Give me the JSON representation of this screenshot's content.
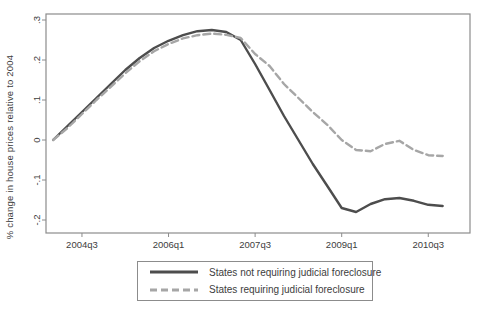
{
  "chart_data": {
    "type": "line",
    "title": "",
    "xlabel": "",
    "ylabel": "% change in house prices relative to 2004",
    "grid": false,
    "legend_position": "bottom-center-boxed",
    "ylim": [
      -0.2,
      0.3
    ],
    "colors": {
      "frame": "#8c8c8c",
      "text": "#3d3d3d",
      "background": "#ffffff"
    },
    "x": [
      "2004q1",
      "2004q2",
      "2004q3",
      "2004q4",
      "2005q1",
      "2005q2",
      "2005q3",
      "2005q4",
      "2006q1",
      "2006q2",
      "2006q3",
      "2006q4",
      "2007q1",
      "2007q2",
      "2007q3",
      "2007q4",
      "2008q1",
      "2008q2",
      "2008q3",
      "2008q4",
      "2009q1",
      "2009q2",
      "2009q3",
      "2009q4",
      "2010q1",
      "2010q2",
      "2010q3",
      "2010q4"
    ],
    "xticks": [
      {
        "label": "2004q3",
        "index": 2
      },
      {
        "label": "2006q1",
        "index": 8
      },
      {
        "label": "2007q3",
        "index": 14
      },
      {
        "label": "2009q1",
        "index": 20
      },
      {
        "label": "2010q3",
        "index": 26
      }
    ],
    "yticks": {
      "values": [
        0.3,
        0.2,
        0.1,
        0,
        -0.1,
        -0.2
      ],
      "labels": [
        ".3",
        ".2",
        ".1",
        "0",
        "-.1",
        "-.2"
      ]
    },
    "series": [
      {
        "name": "States not requiring judicial foreclosure",
        "style": "solid",
        "color": "#4d4d4d",
        "dash": "",
        "values": [
          0.0,
          0.035,
          0.07,
          0.105,
          0.14,
          0.175,
          0.205,
          0.23,
          0.248,
          0.262,
          0.272,
          0.275,
          0.27,
          0.25,
          0.19,
          0.125,
          0.06,
          0.0,
          -0.06,
          -0.115,
          -0.17,
          -0.18,
          -0.16,
          -0.148,
          -0.145,
          -0.152,
          -0.162,
          -0.165
        ]
      },
      {
        "name": "States requiring judicial foreclosure",
        "style": "dashed",
        "color": "#a6a6a6",
        "dash": "7 4",
        "values": [
          0.0,
          0.03,
          0.065,
          0.1,
          0.133,
          0.167,
          0.197,
          0.222,
          0.24,
          0.254,
          0.262,
          0.266,
          0.263,
          0.255,
          0.215,
          0.185,
          0.14,
          0.105,
          0.07,
          0.038,
          0.0,
          -0.025,
          -0.028,
          -0.01,
          -0.002,
          -0.025,
          -0.038,
          -0.04
        ]
      }
    ]
  }
}
